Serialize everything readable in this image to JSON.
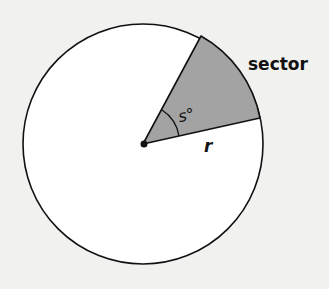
{
  "diagram": {
    "labels": {
      "sector": "sector",
      "angle": "s°",
      "radius": "r"
    },
    "colors": {
      "background": "#f1f1ef",
      "circle_fill": "#ffffff",
      "sector_fill": "#a3a3a3",
      "stroke": "#111111"
    }
  }
}
